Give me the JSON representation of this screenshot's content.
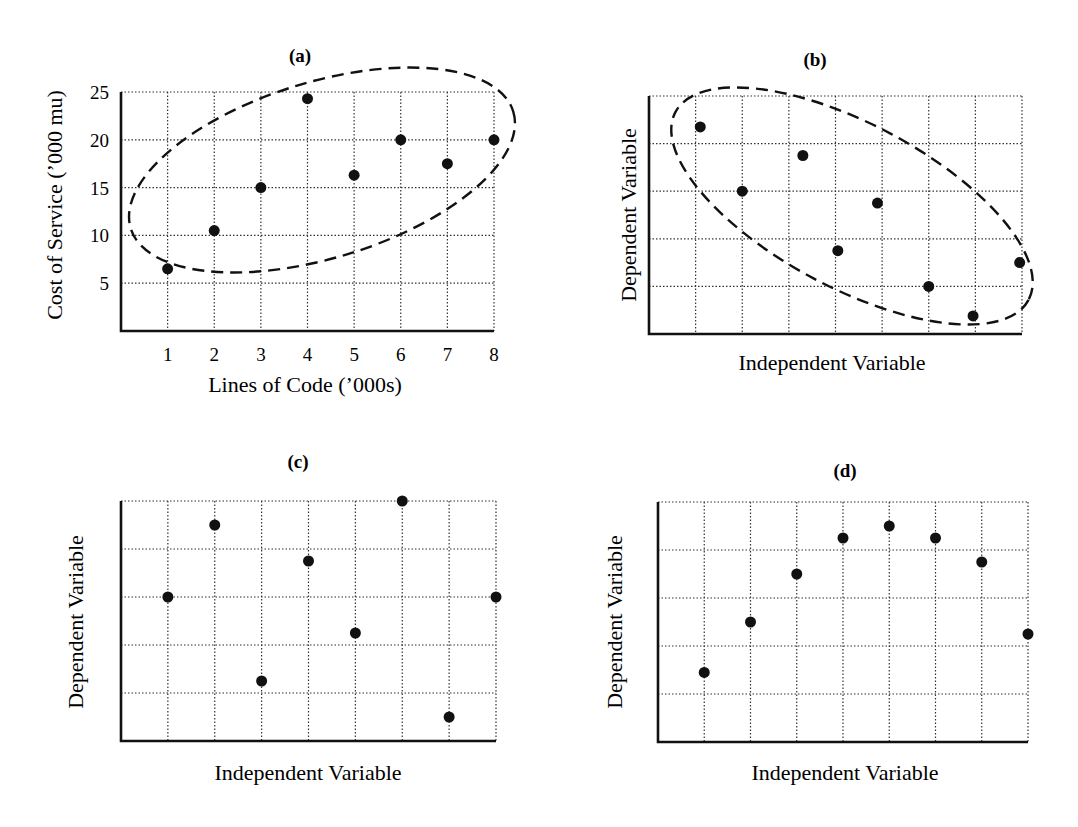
{
  "chart_data": [
    {
      "panel": "a",
      "type": "scatter",
      "title": "(a)",
      "xlabel": "Lines of Code (’000s)",
      "ylabel": "Cost of Service (’000 mu)",
      "x_ticks": [
        "1",
        "2",
        "3",
        "4",
        "5",
        "6",
        "7",
        "8"
      ],
      "y_ticks": [
        "5",
        "10",
        "15",
        "20",
        "25"
      ],
      "xlim": [
        0,
        8
      ],
      "ylim": [
        0,
        25
      ],
      "grid": true,
      "points": [
        [
          1,
          6.5
        ],
        [
          2,
          10.5
        ],
        [
          3,
          15
        ],
        [
          4,
          24.3
        ],
        [
          5,
          16.3
        ],
        [
          6,
          20
        ],
        [
          7,
          17.5
        ],
        [
          8,
          20
        ]
      ],
      "annotation": "dashed ellipse enclosing all points (positive trend)"
    },
    {
      "panel": "b",
      "type": "scatter",
      "title": "(b)",
      "xlabel": "Independent Variable",
      "ylabel": "Dependent Variable",
      "x_ticks": [],
      "y_ticks": [],
      "xlim": [
        0,
        8
      ],
      "ylim": [
        0,
        5
      ],
      "grid": true,
      "points": [
        [
          1.1,
          4.35
        ],
        [
          2,
          3
        ],
        [
          3.3,
          3.75
        ],
        [
          4.05,
          1.75
        ],
        [
          4.9,
          2.75
        ],
        [
          6,
          1
        ],
        [
          6.95,
          0.38
        ],
        [
          7.95,
          1.5
        ]
      ],
      "annotation": "dashed ellipse enclosing all points (negative trend)"
    },
    {
      "panel": "c",
      "type": "scatter",
      "title": "(c)",
      "xlabel": "Independent Variable",
      "ylabel": "Dependent Variable",
      "x_ticks": [],
      "y_ticks": [],
      "xlim": [
        0,
        8
      ],
      "ylim": [
        0,
        5
      ],
      "grid": true,
      "points": [
        [
          1,
          3
        ],
        [
          2,
          4.5
        ],
        [
          3,
          1.25
        ],
        [
          4,
          3.75
        ],
        [
          5,
          2.25
        ],
        [
          6,
          5
        ],
        [
          7,
          0.5
        ],
        [
          8,
          3
        ]
      ]
    },
    {
      "panel": "d",
      "type": "scatter",
      "title": "(d)",
      "xlabel": "Independent Variable",
      "ylabel": "Dependent Variable",
      "x_ticks": [],
      "y_ticks": [],
      "xlim": [
        0,
        8
      ],
      "ylim": [
        0,
        5
      ],
      "grid": true,
      "points": [
        [
          1,
          1.45
        ],
        [
          2,
          2.5
        ],
        [
          3,
          3.5
        ],
        [
          4,
          4.25
        ],
        [
          5,
          4.5
        ],
        [
          6,
          4.25
        ],
        [
          7,
          3.75
        ],
        [
          8,
          2.25
        ]
      ]
    }
  ],
  "layout": {
    "panels": {
      "a": {
        "left": 121,
        "right": 494,
        "top": 92,
        "bottom": 331,
        "title_x": 300,
        "title_y": 62,
        "ylabel_x": 62,
        "ylabel_y": 205,
        "xlabel_x": 305,
        "xlabel_y": 392,
        "ellipse": {
          "cx": 322,
          "cy": 170,
          "rx": 200,
          "ry": 88,
          "rot": -17
        }
      },
      "b": {
        "left": 649,
        "right": 1022,
        "top": 96,
        "bottom": 334,
        "title_x": 815,
        "title_y": 66,
        "ylabel_x": 636,
        "ylabel_y": 215,
        "xlabel_x": 832,
        "xlabel_y": 370,
        "ellipse": {
          "cx": 852,
          "cy": 206,
          "rx": 200,
          "ry": 82,
          "rot": 28
        }
      },
      "c": {
        "left": 121,
        "right": 496,
        "top": 501,
        "bottom": 741,
        "title_x": 298,
        "title_y": 468,
        "ylabel_x": 83,
        "ylabel_y": 622,
        "xlabel_x": 308,
        "xlabel_y": 780
      },
      "d": {
        "left": 658,
        "right": 1028,
        "top": 502,
        "bottom": 742,
        "title_x": 845,
        "title_y": 477,
        "ylabel_x": 622,
        "ylabel_y": 622,
        "xlabel_x": 845,
        "xlabel_y": 780
      }
    }
  }
}
